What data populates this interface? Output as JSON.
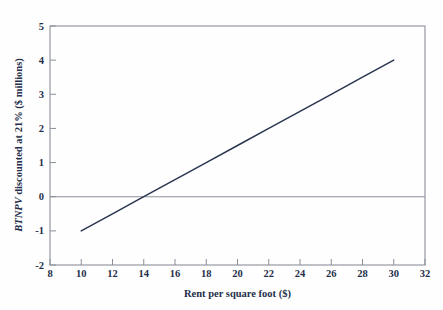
{
  "chart_data": {
    "type": "line",
    "title": "",
    "subtitle": "",
    "xlabel": "Rent per square foot ($)",
    "ylabel": "BTNPV discounted at 21% ($ millions)",
    "ylabel_italic_part": "BTNPV",
    "ylabel_rest_part": " discounted at 21% ($ millions)",
    "xlim": [
      8,
      32
    ],
    "ylim": [
      -2,
      5
    ],
    "xticks": [
      8,
      10,
      12,
      14,
      16,
      18,
      20,
      22,
      24,
      26,
      28,
      30,
      32
    ],
    "yticks": [
      -2,
      -1,
      0,
      1,
      2,
      3,
      4,
      5
    ],
    "xtick_labels": [
      "8",
      "10",
      "12",
      "14",
      "16",
      "18",
      "20",
      "22",
      "24",
      "26",
      "28",
      "30",
      "32"
    ],
    "ytick_labels": [
      "-2",
      "-1",
      "0",
      "1",
      "2",
      "3",
      "4",
      "5"
    ],
    "grid": false,
    "legend": false,
    "legend_position": "none",
    "zero_line": 0,
    "series": [
      {
        "name": "BTNPV",
        "color": "#2a3550",
        "x": [
          10,
          12,
          14,
          16,
          18,
          20,
          22,
          24,
          26,
          28,
          30
        ],
        "values": [
          -1.0,
          -0.5,
          0.0,
          0.5,
          1.0,
          1.5,
          2.0,
          2.5,
          3.0,
          3.5,
          4.0
        ]
      }
    ],
    "breakeven_x": 14,
    "annotations": []
  },
  "figure": {
    "frame_color": "#8a8f9a",
    "background_color": "#fefefe",
    "line_color": "#2a3550",
    "text_color": "#242f4a"
  }
}
